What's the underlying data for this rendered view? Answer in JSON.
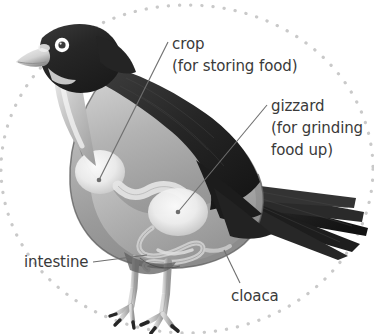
{
  "figure": {
    "species_depiction": "pigeon",
    "background_color": "#ffffff",
    "border": {
      "style": "dotted-oval",
      "dot_color": "#c9c9c9",
      "dot_radius": 1.6
    },
    "leader_line_color": "#6e6e6e",
    "text_color": "#3a3a3a"
  },
  "labels": {
    "crop": {
      "name": "crop",
      "note": "(for storing food)"
    },
    "gizzard": {
      "name": "gizzard",
      "note_line1": "(for grinding",
      "note_line2": "food up)"
    },
    "intestine": {
      "name": "intestine"
    },
    "cloaca": {
      "name": "cloaca"
    }
  },
  "palette": {
    "plumage_dark": "#2b2b2b",
    "plumage_mid": "#6a6a6a",
    "body_grey": "#9b9b9b",
    "body_light": "#cfcfcf",
    "organ_pale": "#f2f2f2",
    "leg_grey": "#b8b8b8",
    "claw_dark": "#262626",
    "beak_light": "#e8e8e8",
    "eye_ring": "#ffffff",
    "eye_pupil": "#3a3a3a"
  }
}
